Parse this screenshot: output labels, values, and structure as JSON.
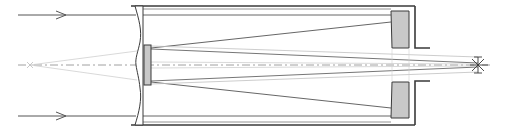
{
  "diagram": {
    "type": "optical-schematic",
    "colors": {
      "line": "#3a3a3a",
      "ray_dark": "#555555",
      "ray_light": "#bdbdbd",
      "axis": "#9a9a9a",
      "mirror_fill": "#c8c8c8",
      "background": "#ffffff"
    },
    "components": [
      {
        "id": "incoming-ray-top",
        "label": "incoming parallel ray (upper)"
      },
      {
        "id": "incoming-ray-bottom",
        "label": "incoming parallel ray (lower)"
      },
      {
        "id": "corrector-plate",
        "label": "corrector plate"
      },
      {
        "id": "secondary-mirror",
        "label": "secondary mirror"
      },
      {
        "id": "primary-mirror",
        "label": "primary mirror"
      },
      {
        "id": "tube",
        "label": "optical tube"
      },
      {
        "id": "optical-axis",
        "label": "optical axis"
      },
      {
        "id": "virtual-focus",
        "label": "virtual focus (marker x)"
      },
      {
        "id": "focal-point",
        "label": "focal point (star marker)"
      }
    ]
  }
}
